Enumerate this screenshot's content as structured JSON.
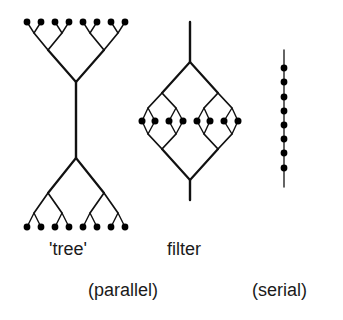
{
  "diagram": {
    "labels": {
      "tree": "'tree'",
      "filter": "filter",
      "parallel": "(parallel)",
      "serial": "(serial)"
    },
    "colors": {
      "ink": "#111111",
      "background": "#ffffff"
    },
    "tree": {
      "leaf_count_top": 8,
      "leaf_count_bottom": 8,
      "leaf_x": [
        27,
        41,
        55,
        69,
        83,
        97,
        111,
        125
      ],
      "top_leaf_y": 22,
      "bottom_leaf_y": 227,
      "trunk_x": 76,
      "trunk_top_y": 82,
      "trunk_bottom_y": 158
    },
    "filter": {
      "stem_x": 190,
      "stem_top_y": 22,
      "diamond_top_y": 62,
      "diamond_bottom_y": 180,
      "stem_bottom_y": 200,
      "node_y": 121,
      "node_x": [
        142,
        155,
        169,
        183,
        197,
        210,
        224,
        238
      ]
    },
    "serial": {
      "line_x": 284,
      "line_top_y": 50,
      "line_bottom_y": 187,
      "node_y": [
        68,
        82,
        97,
        111,
        125,
        139,
        153,
        168
      ]
    }
  }
}
